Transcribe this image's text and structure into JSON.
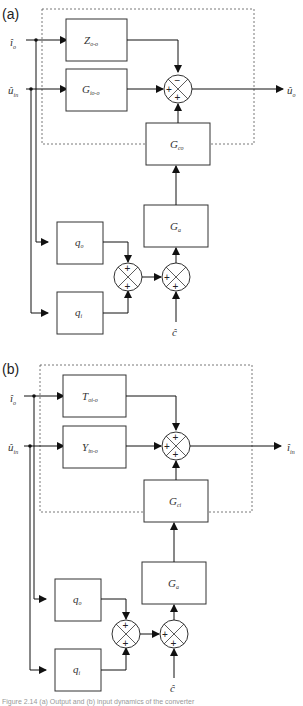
{
  "figure": {
    "panels": [
      {
        "id": "a",
        "label": "(a)",
        "inputs": [
          {
            "symbol": "î",
            "sub": "o"
          },
          {
            "symbol": "û",
            "sub": "in"
          }
        ],
        "output": {
          "symbol": "û",
          "sub": "o"
        },
        "disturbance": {
          "symbol": "ĉ"
        },
        "blocks": {
          "top": {
            "main": "Z",
            "sub": "o-o"
          },
          "mid": {
            "main": "G",
            "sub": "io-o"
          },
          "feedback": {
            "main": "G",
            "sub": "co"
          },
          "actuator": {
            "main": "G",
            "sub": "a"
          },
          "q_upper": {
            "main": "q",
            "sub": "o"
          },
          "q_lower": {
            "main": "q",
            "sub": "i"
          }
        },
        "summing_signs": {
          "main": [
            "−",
            "+",
            "+"
          ],
          "left": [
            "+",
            "+"
          ],
          "right": [
            "+",
            "+"
          ]
        }
      },
      {
        "id": "b",
        "label": "(b)",
        "inputs": [
          {
            "symbol": "î",
            "sub": "o"
          },
          {
            "symbol": "û",
            "sub": "in"
          }
        ],
        "output": {
          "symbol": "î",
          "sub": "in"
        },
        "disturbance": {
          "symbol": "ĉ"
        },
        "blocks": {
          "top": {
            "main": "T",
            "sub": "oi-o"
          },
          "mid": {
            "main": "Y",
            "sub": "in-o"
          },
          "feedback": {
            "main": "G",
            "sub": "ci"
          },
          "actuator": {
            "main": "G",
            "sub": "a"
          },
          "q_upper": {
            "main": "q",
            "sub": "o"
          },
          "q_lower": {
            "main": "q",
            "sub": "i"
          }
        },
        "summing_signs": {
          "main": [
            "+",
            "+",
            "+"
          ],
          "left": [
            "+",
            "+"
          ],
          "right": [
            "+",
            "+"
          ]
        }
      }
    ],
    "caption": "Figure 2.14 (a) Output and (b) input dynamics of the converter"
  }
}
